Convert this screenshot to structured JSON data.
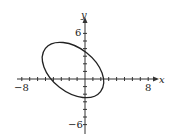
{
  "chart_data": {
    "type": "line",
    "title": "",
    "xlabel": "x",
    "ylabel": "y",
    "xlim": [
      -8,
      8
    ],
    "ylim": [
      -6,
      6
    ],
    "x_tick_labels": [
      "-8",
      "8"
    ],
    "y_tick_labels": [
      "6",
      "-6"
    ],
    "tick_step": 1,
    "grid": false,
    "legend": null,
    "series": [
      {
        "name": "ellipse",
        "shape": "rotated ellipse",
        "center": [
          -1.5,
          1.2
        ],
        "semi_major": 4.5,
        "semi_minor": 2.8,
        "rotation_deg": -38,
        "x_intercepts": [
          -4.9,
          2.1
        ],
        "y_intercepts": [
          4.0,
          -2.6
        ],
        "approx_extents": {
          "xmin": -5.5,
          "xmax": 2.4,
          "ymin": -2.6,
          "ymax": 5.0
        }
      }
    ]
  },
  "labels": {
    "x_axis": "x",
    "y_axis": "y",
    "x_min": "−8",
    "x_max": "8",
    "y_max": "6",
    "y_min": "−6"
  }
}
